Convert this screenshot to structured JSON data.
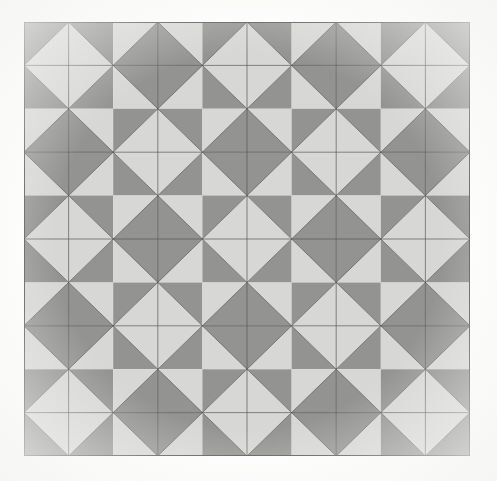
{
  "figure": {
    "medium": "halftone print scan"
  },
  "canvas": {
    "width": 497,
    "height": 481,
    "background_color": "#fefefe"
  },
  "pattern": {
    "origin_x": 24,
    "origin_y": 22,
    "width": 446,
    "height": 434,
    "rows": 5,
    "columns": 5,
    "cell_width": 89.2,
    "cell_height": 86.8,
    "tile_motif": "inscribed-diamond-with-corner-triangles",
    "alternation": "checkerboard",
    "colors": {
      "light_gray": "#d4d4d2",
      "dark_gray": "#8b8b89",
      "line": "#4a4a4a",
      "border": "#4a4a4a"
    },
    "line_width": 0.7,
    "border_width": 1.0,
    "tiles": [
      [
        {
          "row": 0,
          "col": 0,
          "diamond": "light",
          "corners": "dark"
        },
        {
          "row": 0,
          "col": 1,
          "diamond": "dark",
          "corners": "light"
        },
        {
          "row": 0,
          "col": 2,
          "diamond": "light",
          "corners": "dark"
        },
        {
          "row": 0,
          "col": 3,
          "diamond": "dark",
          "corners": "light"
        },
        {
          "row": 0,
          "col": 4,
          "diamond": "light",
          "corners": "dark"
        }
      ],
      [
        {
          "row": 1,
          "col": 0,
          "diamond": "dark",
          "corners": "light"
        },
        {
          "row": 1,
          "col": 1,
          "diamond": "light",
          "corners": "dark"
        },
        {
          "row": 1,
          "col": 2,
          "diamond": "dark",
          "corners": "light"
        },
        {
          "row": 1,
          "col": 3,
          "diamond": "light",
          "corners": "dark"
        },
        {
          "row": 1,
          "col": 4,
          "diamond": "dark",
          "corners": "light"
        }
      ],
      [
        {
          "row": 2,
          "col": 0,
          "diamond": "light",
          "corners": "dark"
        },
        {
          "row": 2,
          "col": 1,
          "diamond": "dark",
          "corners": "light"
        },
        {
          "row": 2,
          "col": 2,
          "diamond": "light",
          "corners": "dark"
        },
        {
          "row": 2,
          "col": 3,
          "diamond": "dark",
          "corners": "light"
        },
        {
          "row": 2,
          "col": 4,
          "diamond": "light",
          "corners": "dark"
        }
      ],
      [
        {
          "row": 3,
          "col": 0,
          "diamond": "dark",
          "corners": "light"
        },
        {
          "row": 3,
          "col": 1,
          "diamond": "light",
          "corners": "dark"
        },
        {
          "row": 3,
          "col": 2,
          "diamond": "dark",
          "corners": "light"
        },
        {
          "row": 3,
          "col": 3,
          "diamond": "light",
          "corners": "dark"
        },
        {
          "row": 3,
          "col": 4,
          "diamond": "dark",
          "corners": "light"
        }
      ],
      [
        {
          "row": 4,
          "col": 0,
          "diamond": "light",
          "corners": "dark"
        },
        {
          "row": 4,
          "col": 1,
          "diamond": "dark",
          "corners": "light"
        },
        {
          "row": 4,
          "col": 2,
          "diamond": "light",
          "corners": "dark"
        },
        {
          "row": 4,
          "col": 3,
          "diamond": "dark",
          "corners": "light"
        },
        {
          "row": 4,
          "col": 4,
          "diamond": "light",
          "corners": "dark"
        }
      ]
    ]
  }
}
